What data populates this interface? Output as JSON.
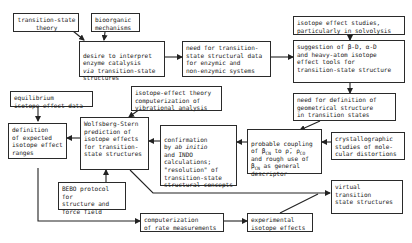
{
  "diagram": {
    "type": "flowchart",
    "nodes": {
      "ts_theory": {
        "label": "transition-state\ntheory"
      },
      "bioorganic": {
        "label": "bioorganic\nmechanisms"
      },
      "desire": {
        "label": "desire to interpret\nenzyme catalysis\nvia transition-state\nstructures"
      },
      "need_data": {
        "label": "need for transition-\nstate structural data\nfor enzymic and\nnon-enzymic systems"
      },
      "isotope_studies": {
        "label": "isotope effect studies,\nparticularly in solvolysis"
      },
      "suggestion": {
        "label": "suggestion of β-D, α-D\nand heavy-atom isotope\neffect tools for\ntransition-state structure"
      },
      "need_definition": {
        "label": "need for definition of\ngeometrical structure\nin transition states"
      },
      "equilibrium": {
        "label": "equilibrium\nisotope-effect data"
      },
      "iso_theory": {
        "label": "isotope-effect theory\ncomputerization of\nvibrational analysis"
      },
      "definition_ranges": {
        "label": "definition\nof expected\nisotope effect\nranges"
      },
      "wolfsberg": {
        "label": "Wolfsberg-Stern\nprediction of\nisotope effects\nfor transition-\nstate structures"
      },
      "confirmation": {
        "label": "confirmation\nby ab initio\nand INDO\ncalculations;\n\"resolution\" of\ntransition-state\nstructural concepts"
      },
      "coupling": {
        "label": "probable coupling\nof βCN to ρ, ρCO\nand rough use of\nβCN as general\ndescriptor"
      },
      "crystallographic": {
        "label": "crystallographic\nstudies of mole-\ncular distortions"
      },
      "bebo": {
        "label": "BEBO protocol for\nstructure and\nforce field"
      },
      "virtual": {
        "label": "virtual\ntransition\nstate structures"
      },
      "computerization": {
        "label": "computerization\nof rate measurements"
      },
      "experimental": {
        "label": "experimental\nisotope effects"
      }
    },
    "edges": [
      {
        "from": "ts_theory",
        "to": "desire"
      },
      {
        "from": "bioorganic",
        "to": "desire"
      },
      {
        "from": "desire",
        "to": "need_data"
      },
      {
        "from": "need_data",
        "to": "suggestion"
      },
      {
        "from": "isotope_studies",
        "to": "suggestion"
      },
      {
        "from": "suggestion",
        "to": "need_definition"
      },
      {
        "from": "need_definition",
        "to": "coupling"
      },
      {
        "from": "crystallographic",
        "to": "coupling"
      },
      {
        "from": "coupling",
        "to": "confirmation"
      },
      {
        "from": "confirmation",
        "to": "wolfsberg"
      },
      {
        "from": "iso_theory",
        "to": "wolfsberg"
      },
      {
        "from": "wolfsberg",
        "to": "definition_ranges"
      },
      {
        "from": "equilibrium",
        "to": "definition_ranges"
      },
      {
        "from": "bebo",
        "to": "wolfsberg"
      },
      {
        "from": "wolfsberg",
        "to": "virtual"
      },
      {
        "from": "definition_ranges",
        "to": "computerization"
      },
      {
        "from": "computerization",
        "to": "experimental"
      },
      {
        "from": "experimental",
        "to": "virtual"
      }
    ]
  }
}
